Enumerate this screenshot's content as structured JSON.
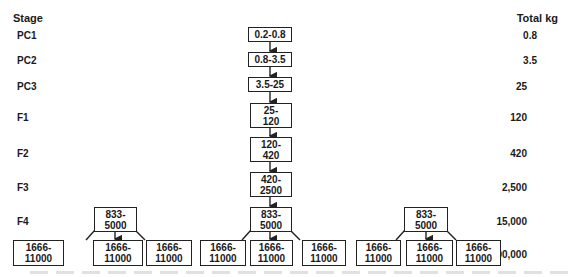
{
  "headers": {
    "stage": "Stage",
    "total": "Total kg"
  },
  "stages": [
    {
      "id": "PC1",
      "label": "PC1",
      "range": "0.2-0.8",
      "total": "0.8"
    },
    {
      "id": "PC2",
      "label": "PC2",
      "range": "0.8-3.5",
      "total": "3.5"
    },
    {
      "id": "PC3",
      "label": "PC3",
      "range": "3.5-25",
      "total": "25"
    },
    {
      "id": "F1",
      "label": "F1",
      "range": "25-\n120",
      "total": "120"
    },
    {
      "id": "F2",
      "label": "F2",
      "range": "120-\n420",
      "total": "420"
    },
    {
      "id": "F3",
      "label": "F3",
      "range": "420-\n2500",
      "total": "2,500"
    },
    {
      "id": "F4",
      "label": "F4",
      "range": "833-\n5000",
      "total": "15,000"
    },
    {
      "id": "F5",
      "label": "F5",
      "range": "1666-\n11000",
      "total": "100,000"
    }
  ],
  "f4_boxes": [
    "833-\n5000",
    "833-\n5000",
    "833-\n5000"
  ],
  "f5_boxes": [
    "1666-\n11000",
    "1666-\n11000",
    "1666-\n11000",
    "1666-\n11000",
    "1666-\n11000",
    "1666-\n11000",
    "1666-\n11000",
    "1666-\n11000",
    "1666-\n11000"
  ],
  "colors": {
    "line": "#222222",
    "text": "#1a1a1a",
    "background": "#ffffff"
  }
}
